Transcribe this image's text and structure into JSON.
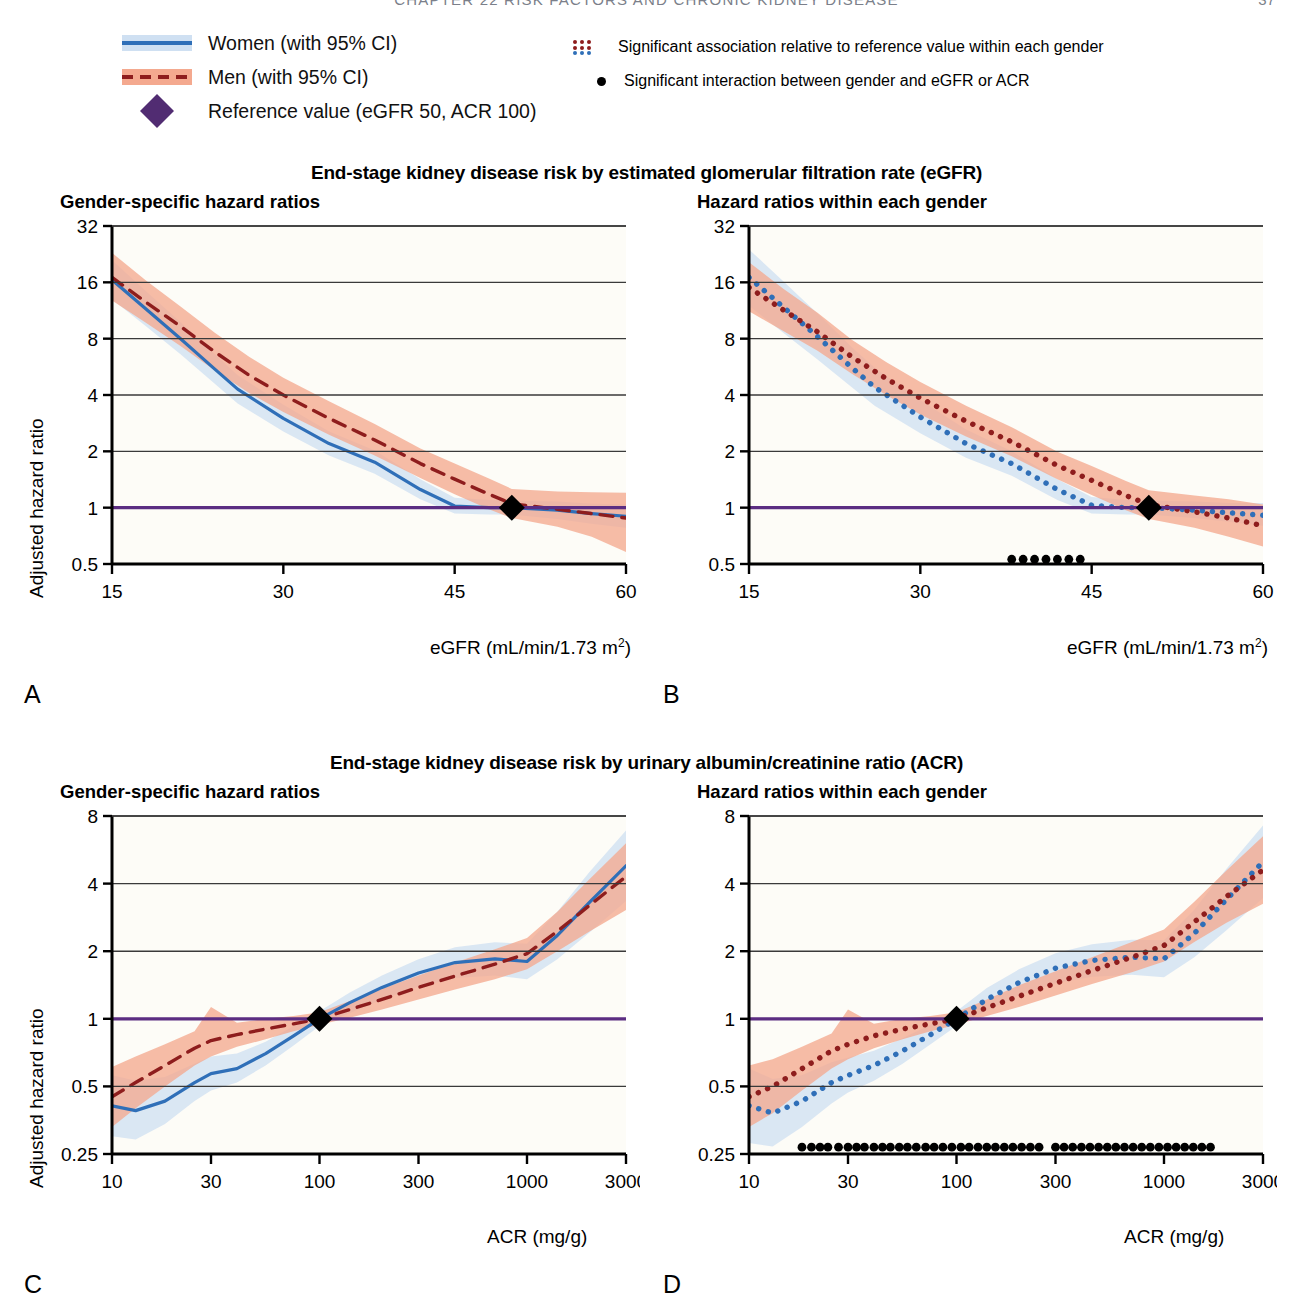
{
  "running_head": {
    "text": "CHAPTER 22    RISK FACTORS AND CHRONIC KIDNEY DISEASE",
    "page": "37"
  },
  "legend": {
    "women": "Women (with 95% CI)",
    "men": "Men (with 95% CI)",
    "reference": "Reference value (eGFR 50, ACR 100)",
    "significant_association": "Significant association relative to reference value within each gender",
    "significant_interaction": "Significant interaction between gender and eGFR or ACR"
  },
  "colors": {
    "women_line": "#2f6fb8",
    "women_band": "#cfe0f2",
    "men_line": "#8e1d1d",
    "men_band": "#f4a98f",
    "reference_line": "#5b2d82",
    "reference_marker": "#512c72",
    "marker_black": "#000000",
    "axis": "#000000",
    "gridline": "#3a3a3a",
    "plot_bg": "#fdfcf7"
  },
  "figures": [
    {
      "id": "egfr",
      "title": "End-stage kidney disease risk by estimated glomerular filtration rate (eGFR)",
      "ylabel": "Adjusted hazard ratio",
      "xlabel_html": "eGFR (mL/min/1.73 m2)",
      "panels": [
        {
          "letter": "A",
          "subtitle": "Gender-specific hazard ratios"
        },
        {
          "letter": "B",
          "subtitle": "Hazard ratios within each gender"
        }
      ]
    },
    {
      "id": "acr",
      "title": "End-stage kidney disease risk by urinary albumin/creatinine ratio (ACR)",
      "ylabel": "Adjusted hazard ratio",
      "xlabel_html": "ACR (mg/g)",
      "panels": [
        {
          "letter": "C",
          "subtitle": "Gender-specific hazard ratios"
        },
        {
          "letter": "D",
          "subtitle": "Hazard ratios within each gender"
        }
      ]
    }
  ],
  "chart_data": [
    {
      "id": "panel-A",
      "type": "line",
      "title": "Gender-specific hazard ratios",
      "xlabel": "eGFR (mL/min/1.73 m2)",
      "ylabel": "Adjusted hazard ratio",
      "xscale": "linear",
      "yscale": "log",
      "xlim": [
        15,
        60
      ],
      "ylim": [
        0.5,
        32
      ],
      "xticks": [
        15,
        30,
        45,
        60
      ],
      "yticks": [
        0.5,
        1,
        2,
        4,
        8,
        16,
        32
      ],
      "ytick_labels": [
        "0.5",
        "1",
        "2",
        "4",
        "8",
        "16",
        "32"
      ],
      "grid": "horizontal",
      "reference_point": {
        "x": 50,
        "y": 1
      },
      "reference_line_y": 1,
      "series": [
        {
          "name": "Women (with 95% CI)",
          "style": "solid",
          "color": "#2f6fb8",
          "x": [
            15,
            18,
            21,
            24,
            26,
            30,
            34,
            38,
            42,
            45,
            48,
            50,
            54,
            57,
            60
          ],
          "y": [
            16.5,
            11.5,
            8.0,
            5.5,
            4.3,
            3.0,
            2.2,
            1.75,
            1.25,
            1.02,
            1.0,
            1.0,
            0.97,
            0.93,
            0.9
          ],
          "ci_lower": [
            13.0,
            9.3,
            6.6,
            4.6,
            3.6,
            2.55,
            1.9,
            1.52,
            1.11,
            0.93,
            0.92,
            0.92,
            0.87,
            0.82,
            0.78
          ],
          "ci_upper": [
            21.0,
            14.3,
            9.8,
            6.6,
            5.1,
            3.55,
            2.55,
            2.02,
            1.42,
            1.13,
            1.1,
            1.09,
            1.08,
            1.05,
            1.04
          ]
        },
        {
          "name": "Men (with 95% CI)",
          "style": "dashed",
          "color": "#8e1d1d",
          "x": [
            15,
            18,
            21,
            24,
            27,
            30,
            34,
            38,
            42,
            45,
            48,
            50,
            54,
            57,
            60
          ],
          "y": [
            17.0,
            12.5,
            9.3,
            6.8,
            5.1,
            4.0,
            3.0,
            2.3,
            1.72,
            1.42,
            1.18,
            1.05,
            0.98,
            0.93,
            0.88
          ],
          "ci_lower": [
            12.8,
            9.7,
            7.3,
            5.4,
            4.1,
            3.25,
            2.45,
            1.9,
            1.44,
            1.18,
            0.98,
            0.88,
            0.79,
            0.7,
            0.58
          ],
          "ci_upper": [
            23.0,
            16.3,
            11.9,
            8.6,
            6.4,
            4.95,
            3.7,
            2.8,
            2.07,
            1.72,
            1.43,
            1.26,
            1.22,
            1.21,
            1.2
          ]
        }
      ]
    },
    {
      "id": "panel-B",
      "type": "line",
      "title": "Hazard ratios within each gender",
      "xlabel": "eGFR (mL/min/1.73 m2)",
      "ylabel": "Adjusted hazard ratio",
      "xscale": "linear",
      "yscale": "log",
      "xlim": [
        15,
        60
      ],
      "ylim": [
        0.5,
        32
      ],
      "xticks": [
        15,
        30,
        45,
        60
      ],
      "yticks": [
        0.5,
        1,
        2,
        4,
        8,
        16,
        32
      ],
      "grid": "horizontal",
      "reference_point": {
        "x": 50,
        "y": 1
      },
      "reference_line_y": 1,
      "interaction_markers": {
        "y": 0.53,
        "x": [
          38,
          39,
          40,
          41,
          42,
          43,
          44
        ]
      },
      "series": [
        {
          "name": "Women (with 95% CI)",
          "style": "dotted",
          "color": "#2f6fb8",
          "x": [
            15,
            18,
            21,
            24,
            26,
            30,
            34,
            38,
            42,
            45,
            48,
            50,
            54,
            57,
            60
          ],
          "y": [
            17.0,
            11.8,
            8.2,
            5.6,
            4.4,
            3.05,
            2.2,
            1.72,
            1.25,
            1.03,
            1.0,
            1.0,
            0.97,
            0.94,
            0.91
          ],
          "ci_lower": [
            12.0,
            8.6,
            6.2,
            4.4,
            3.5,
            2.5,
            1.85,
            1.48,
            1.1,
            0.93,
            0.92,
            0.92,
            0.88,
            0.84,
            0.8
          ],
          "ci_upper": [
            24.0,
            16.2,
            10.9,
            7.2,
            5.6,
            3.75,
            2.62,
            2.0,
            1.42,
            1.14,
            1.1,
            1.09,
            1.08,
            1.06,
            1.06
          ]
        },
        {
          "name": "Men (with 95% CI)",
          "style": "dotted",
          "color": "#8e1d1d",
          "x": [
            15,
            18,
            21,
            24,
            27,
            30,
            34,
            38,
            42,
            45,
            48,
            50,
            54,
            57,
            60
          ],
          "y": [
            15.0,
            11.4,
            8.7,
            6.4,
            4.9,
            3.85,
            2.9,
            2.25,
            1.68,
            1.4,
            1.16,
            1.04,
            0.95,
            0.88,
            0.8
          ],
          "ci_lower": [
            11.2,
            8.8,
            6.9,
            5.2,
            4.0,
            3.15,
            2.4,
            1.88,
            1.42,
            1.17,
            0.97,
            0.87,
            0.78,
            0.7,
            0.62
          ],
          "ci_upper": [
            20.5,
            14.8,
            11.0,
            7.9,
            6.0,
            4.7,
            3.5,
            2.69,
            1.99,
            1.67,
            1.39,
            1.24,
            1.16,
            1.11,
            1.04
          ]
        }
      ]
    },
    {
      "id": "panel-C",
      "type": "line",
      "title": "Gender-specific hazard ratios",
      "xlabel": "ACR (mg/g)",
      "ylabel": "Adjusted hazard ratio",
      "xscale": "log",
      "yscale": "log",
      "xlim": [
        10,
        3000
      ],
      "ylim": [
        0.25,
        8
      ],
      "xticks": [
        10,
        30,
        100,
        300,
        1000,
        3000
      ],
      "yticks": [
        0.25,
        0.5,
        1,
        2,
        4,
        8
      ],
      "ytick_labels": [
        "0.25",
        "0.5",
        "1",
        "2",
        "4",
        "8"
      ],
      "grid": "horizontal",
      "reference_point": {
        "x": 100,
        "y": 1
      },
      "reference_line_y": 1,
      "series": [
        {
          "name": "Women (with 95% CI)",
          "style": "solid",
          "color": "#2f6fb8",
          "x": [
            10,
            13,
            18,
            25,
            30,
            40,
            55,
            75,
            100,
            140,
            200,
            300,
            450,
            700,
            1000,
            1400,
            2000,
            3000
          ],
          "y": [
            0.41,
            0.39,
            0.43,
            0.52,
            0.57,
            0.6,
            0.7,
            0.84,
            1.0,
            1.18,
            1.38,
            1.6,
            1.78,
            1.85,
            1.8,
            2.35,
            3.3,
            4.8
          ],
          "ci_lower": [
            0.3,
            0.29,
            0.34,
            0.43,
            0.48,
            0.52,
            0.62,
            0.76,
            0.93,
            1.06,
            1.22,
            1.39,
            1.52,
            1.56,
            1.5,
            1.84,
            2.42,
            3.35
          ],
          "ci_upper": [
            0.56,
            0.53,
            0.55,
            0.63,
            0.68,
            0.7,
            0.79,
            0.93,
            1.08,
            1.31,
            1.56,
            1.84,
            2.08,
            2.19,
            2.16,
            3.0,
            4.5,
            6.9
          ]
        },
        {
          "name": "Men (with 95% CI)",
          "style": "dashed",
          "color": "#8e1d1d",
          "x": [
            10,
            13,
            18,
            25,
            30,
            40,
            55,
            75,
            100,
            140,
            200,
            300,
            450,
            700,
            1000,
            1400,
            2000,
            3000
          ],
          "y": [
            0.45,
            0.52,
            0.62,
            0.74,
            0.8,
            0.85,
            0.9,
            0.95,
            1.0,
            1.1,
            1.22,
            1.38,
            1.55,
            1.75,
            1.95,
            2.45,
            3.2,
            4.3
          ],
          "ci_lower": [
            0.33,
            0.4,
            0.5,
            0.62,
            0.68,
            0.75,
            0.81,
            0.88,
            0.94,
            1.01,
            1.1,
            1.22,
            1.35,
            1.5,
            1.66,
            2.0,
            2.45,
            3.05
          ],
          "ci_upper": [
            0.61,
            0.68,
            0.77,
            0.88,
            1.13,
            0.96,
            1.0,
            1.03,
            1.07,
            1.2,
            1.36,
            1.56,
            1.78,
            2.04,
            2.29,
            3.0,
            4.18,
            6.05
          ]
        }
      ]
    },
    {
      "id": "panel-D",
      "type": "line",
      "title": "Hazard ratios within each gender",
      "xlabel": "ACR (mg/g)",
      "ylabel": "Adjusted hazard ratio",
      "xscale": "log",
      "yscale": "log",
      "xlim": [
        10,
        3000
      ],
      "ylim": [
        0.25,
        8
      ],
      "xticks": [
        10,
        30,
        100,
        300,
        1000,
        3000
      ],
      "yticks": [
        0.25,
        0.5,
        1,
        2,
        4,
        8
      ],
      "grid": "horizontal",
      "reference_point": {
        "x": 100,
        "y": 1
      },
      "reference_line_y": 1,
      "interaction_markers": {
        "y": 0.268,
        "x": [
          18,
          20,
          22,
          24,
          27,
          30,
          33,
          36,
          40,
          44,
          48,
          53,
          58,
          64,
          71,
          78,
          86,
          95,
          105,
          115,
          127,
          140,
          154,
          170,
          187,
          206,
          227,
          250,
          300,
          330,
          363,
          400,
          440,
          484,
          533,
          586,
          645,
          710,
          781,
          859,
          945,
          1040,
          1144,
          1258,
          1384,
          1522,
          1675
        ]
      },
      "series": [
        {
          "name": "Women (with 95% CI)",
          "style": "dotted",
          "color": "#2f6fb8",
          "x": [
            10,
            13,
            18,
            25,
            30,
            40,
            55,
            75,
            100,
            140,
            200,
            300,
            450,
            700,
            1000,
            1400,
            2000,
            3000
          ],
          "y": [
            0.41,
            0.38,
            0.43,
            0.52,
            0.56,
            0.62,
            0.72,
            0.85,
            1.0,
            1.22,
            1.45,
            1.68,
            1.82,
            1.88,
            1.85,
            2.4,
            3.4,
            5.0
          ],
          "ci_lower": [
            0.28,
            0.27,
            0.33,
            0.42,
            0.47,
            0.53,
            0.63,
            0.77,
            0.93,
            1.09,
            1.27,
            1.44,
            1.54,
            1.57,
            1.53,
            1.88,
            2.48,
            3.45
          ],
          "ci_upper": [
            0.6,
            0.54,
            0.56,
            0.64,
            0.67,
            0.72,
            0.82,
            0.94,
            1.08,
            1.37,
            1.66,
            1.96,
            2.15,
            2.25,
            2.24,
            3.06,
            4.66,
            7.25
          ]
        },
        {
          "name": "Men (with 95% CI)",
          "style": "dotted",
          "color": "#8e1d1d",
          "x": [
            10,
            13,
            18,
            25,
            30,
            40,
            55,
            75,
            100,
            140,
            200,
            300,
            450,
            700,
            1000,
            1400,
            2000,
            3000
          ],
          "y": [
            0.45,
            0.5,
            0.6,
            0.72,
            0.77,
            0.84,
            0.9,
            0.95,
            1.0,
            1.12,
            1.26,
            1.44,
            1.64,
            1.88,
            2.12,
            2.7,
            3.5,
            4.6
          ],
          "ci_lower": [
            0.33,
            0.38,
            0.48,
            0.6,
            0.66,
            0.74,
            0.81,
            0.88,
            0.94,
            1.03,
            1.13,
            1.27,
            1.43,
            1.61,
            1.8,
            2.2,
            2.68,
            3.25
          ],
          "ci_upper": [
            0.62,
            0.66,
            0.75,
            0.86,
            1.1,
            0.95,
            1.0,
            1.03,
            1.07,
            1.22,
            1.41,
            1.63,
            1.88,
            2.2,
            2.5,
            3.32,
            4.57,
            6.5
          ]
        }
      ]
    }
  ]
}
